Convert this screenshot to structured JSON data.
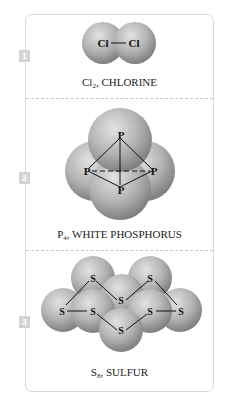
{
  "figure": {
    "panels": [
      {
        "number": "1",
        "formula_base": "Cl",
        "formula_sub": "2",
        "name": ", CHLORINE",
        "atom_label": "Cl"
      },
      {
        "number": "2",
        "formula_base": "P",
        "formula_sub": "4",
        "name": ", WHITE PHOSPHORUS",
        "atom_label": "P"
      },
      {
        "number": "3",
        "formula_base": "S",
        "formula_sub": "8",
        "name": ", SULFUR",
        "atom_label": "S"
      }
    ]
  },
  "colors": {
    "sphere_light": "#d2d2d2",
    "sphere_dark": "#8a8a8a",
    "badge": "#d4d4d4",
    "border": "#d9d9d9"
  }
}
